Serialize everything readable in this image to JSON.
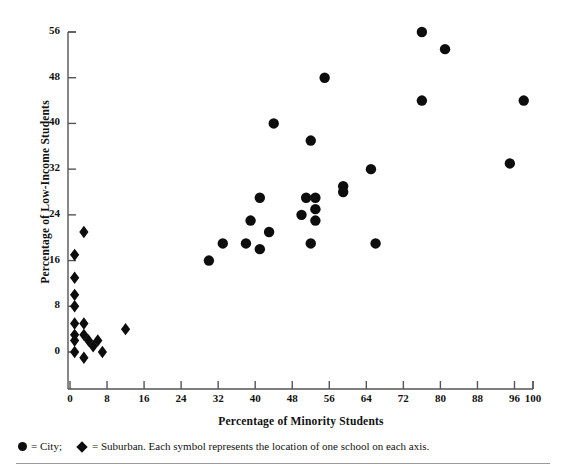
{
  "chart_data": {
    "type": "scatter",
    "title": "",
    "xlabel": "Percentage of Minority Students",
    "ylabel": "Percentage of Low-Income Students",
    "xlim": [
      0,
      100
    ],
    "ylim": [
      -4,
      56
    ],
    "xticks": [
      0,
      8,
      16,
      24,
      32,
      40,
      48,
      56,
      64,
      72,
      80,
      88,
      96,
      100
    ],
    "yticks": [
      0,
      8,
      16,
      24,
      32,
      40,
      48,
      56
    ],
    "grid": false,
    "legend_position": "below-axes",
    "note": "Each symbol represents the location of one school on each axis.",
    "series": [
      {
        "name": "City",
        "marker": "circle",
        "color": "#0d0d0d",
        "points": [
          [
            30,
            16
          ],
          [
            33,
            19
          ],
          [
            38,
            19
          ],
          [
            39,
            23
          ],
          [
            41,
            18
          ],
          [
            41,
            27
          ],
          [
            43,
            21
          ],
          [
            44,
            40
          ],
          [
            50,
            24
          ],
          [
            51,
            27
          ],
          [
            52,
            19
          ],
          [
            52,
            37
          ],
          [
            53,
            27
          ],
          [
            53,
            25
          ],
          [
            53,
            23
          ],
          [
            55,
            48
          ],
          [
            59,
            29
          ],
          [
            59,
            28
          ],
          [
            65,
            32
          ],
          [
            66,
            19
          ],
          [
            76,
            56
          ],
          [
            76,
            44
          ],
          [
            81,
            53
          ],
          [
            95,
            33
          ],
          [
            98,
            44
          ]
        ]
      },
      {
        "name": "Suburban",
        "marker": "diamond",
        "color": "#0d0d0d",
        "points": [
          [
            1,
            17
          ],
          [
            1,
            13
          ],
          [
            1,
            10
          ],
          [
            1,
            8
          ],
          [
            1,
            5
          ],
          [
            1,
            3
          ],
          [
            1,
            2
          ],
          [
            1,
            0
          ],
          [
            3,
            21
          ],
          [
            3,
            5
          ],
          [
            3,
            3
          ],
          [
            3,
            -1
          ],
          [
            4,
            2
          ],
          [
            5,
            1
          ],
          [
            6,
            2
          ],
          [
            7,
            0
          ],
          [
            12,
            4
          ]
        ]
      }
    ]
  },
  "legend": {
    "city_symbol": "filled-circle",
    "city_label": "= City;",
    "suburban_symbol": "filled-diamond",
    "suburban_label": "= Suburban. Each symbol represents the location of one school on each axis."
  }
}
